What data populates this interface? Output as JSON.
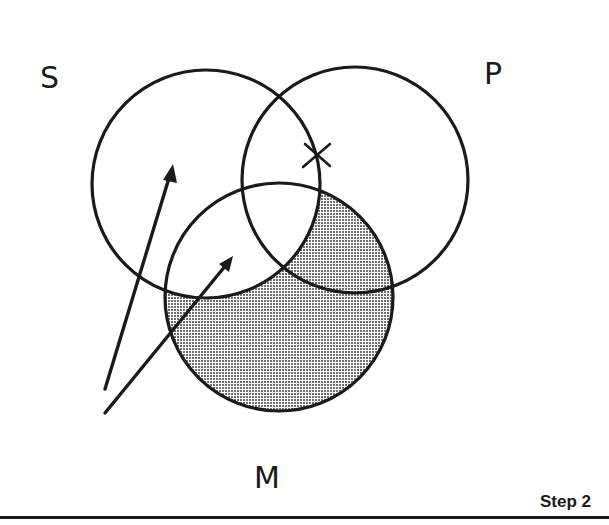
{
  "figure": {
    "type": "venn-diagram",
    "step_label": "Step 2",
    "colors": {
      "stroke": "#1a1a1a",
      "shading": "#bdbdbd",
      "background": "#ffffff"
    },
    "sets": [
      {
        "id": "S",
        "label": "S",
        "cx": 206,
        "cy": 184,
        "r": 114,
        "label_x": 40,
        "label_y": 88
      },
      {
        "id": "P",
        "label": "P",
        "cx": 355,
        "cy": 180,
        "r": 113,
        "label_x": 484,
        "label_y": 84
      },
      {
        "id": "M",
        "label": "M",
        "cx": 279,
        "cy": 297,
        "r": 114,
        "label_x": 254,
        "label_y": 488
      }
    ],
    "shaded_region": "M outside S",
    "x_mark": {
      "label": "X",
      "cx": 317,
      "cy": 155,
      "region": "S and P, on border of S"
    },
    "arrows": [
      {
        "from": [
          105,
          389
        ],
        "to": [
          173,
          165
        ],
        "points_to": "S only"
      },
      {
        "from": [
          105,
          413
        ],
        "to": [
          233,
          257
        ],
        "points_to": "S and M"
      }
    ]
  }
}
